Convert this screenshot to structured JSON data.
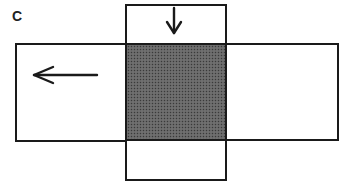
{
  "figure": {
    "panel_label": "C",
    "colors": {
      "line": "#1a1a1a",
      "fill_shaded": "#666666",
      "background": "#ffffff"
    },
    "regions": [
      {
        "name": "top-box",
        "shaded": false
      },
      {
        "name": "left-box",
        "shaded": false
      },
      {
        "name": "center-box",
        "shaded": true
      },
      {
        "name": "right-box",
        "shaded": false
      },
      {
        "name": "bottom-box",
        "shaded": false
      }
    ],
    "arrows": [
      {
        "name": "left-arrow",
        "direction": "left",
        "location": "left-box"
      },
      {
        "name": "down-arrow",
        "direction": "down",
        "location": "top-box"
      }
    ]
  }
}
